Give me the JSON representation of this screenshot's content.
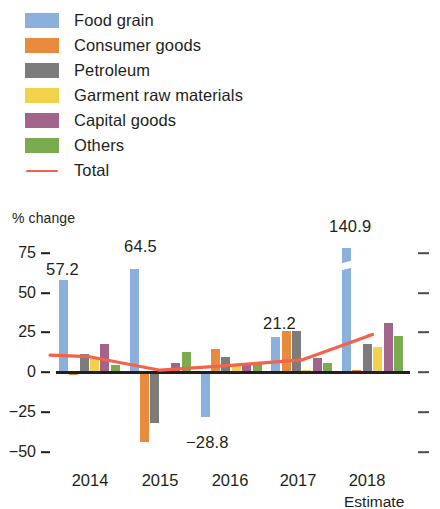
{
  "chart_data": {
    "type": "bar",
    "title": "",
    "subtitle": "",
    "xlabel": "",
    "ylabel": "% change",
    "categories": [
      "2014",
      "2015",
      "2016",
      "2017",
      "2018"
    ],
    "category_note": "Estimate",
    "ylim": [
      -50,
      75
    ],
    "yticks": [
      75,
      50,
      25,
      0,
      -25,
      -50
    ],
    "ytick_labels": [
      "75",
      "50",
      "25",
      "0",
      "−25",
      "−50"
    ],
    "grid": false,
    "legend_position": "top-left",
    "series": [
      {
        "name": "Food grain",
        "color": "#8ab0de",
        "values": [
          57.2,
          64.5,
          -28.8,
          21.2,
          140.9
        ]
      },
      {
        "name": "Consumer goods",
        "color": "#e98b3c",
        "values": [
          -2.5,
          -45.0,
          14.0,
          25.0,
          0.5
        ]
      },
      {
        "name": "Petroleum",
        "color": "#7c7c7c",
        "values": [
          10.5,
          -33.0,
          9.0,
          25.0,
          17.0
        ]
      },
      {
        "name": "Garment raw materials",
        "color": "#f2d24b",
        "values": [
          7.5,
          1.5,
          4.0,
          0.6,
          15.0
        ]
      },
      {
        "name": "Capital goods",
        "color": "#a3648c",
        "values": [
          17.0,
          5.0,
          4.0,
          8.0,
          30.0
        ]
      },
      {
        "name": "Others",
        "color": "#7aab4e",
        "values": [
          3.5,
          12.0,
          5.0,
          5.0,
          22.0
        ]
      }
    ],
    "total_series": {
      "name": "Total",
      "color": "#f4624a",
      "values": [
        9.0,
        0.5,
        3.5,
        7.0,
        23.0
      ]
    },
    "data_labels": [
      {
        "text": "57.2",
        "series": "Food grain",
        "category": "2014"
      },
      {
        "text": "64.5",
        "series": "Food grain",
        "category": "2015"
      },
      {
        "text": "−28.8",
        "series": "Food grain",
        "category": "2016"
      },
      {
        "text": "21.2",
        "series": "Food grain",
        "category": "2017"
      },
      {
        "text": "140.9",
        "series": "Food grain",
        "category": "2018"
      }
    ],
    "broken_axis_bar": {
      "series": "Food grain",
      "category": "2018",
      "note": "bar truncated with axis break"
    }
  },
  "legend": {
    "items": [
      {
        "label": "Food grain",
        "swatch": "legend-swatch-food-grain",
        "color": "#8ab0de",
        "type": "swatch"
      },
      {
        "label": "Consumer goods",
        "swatch": "legend-swatch-consumer-goods",
        "color": "#e98b3c",
        "type": "swatch"
      },
      {
        "label": "Petroleum",
        "swatch": "legend-swatch-petroleum",
        "color": "#7c7c7c",
        "type": "swatch"
      },
      {
        "label": "Garment raw materials",
        "swatch": "legend-swatch-garment-raw-materials",
        "color": "#f2d24b",
        "type": "swatch"
      },
      {
        "label": "Capital goods",
        "swatch": "legend-swatch-capital-goods",
        "color": "#a3648c",
        "type": "swatch"
      },
      {
        "label": "Others",
        "swatch": "legend-swatch-others",
        "color": "#7aab4e",
        "type": "swatch"
      },
      {
        "label": "Total",
        "swatch": "legend-line-total",
        "color": "#f4624a",
        "type": "line"
      }
    ]
  },
  "axes": {
    "y_title": "% change",
    "y_labels": [
      "75",
      "50",
      "25",
      "0",
      "−25",
      "−50"
    ],
    "x_labels": [
      "2014",
      "2015",
      "2016",
      "2017",
      "2018"
    ],
    "x_note": "Estimate"
  },
  "labels": {
    "v2014": "57.2",
    "v2015": "64.5",
    "v2016": "−28.8",
    "v2017": "21.2",
    "v2018": "140.9"
  }
}
